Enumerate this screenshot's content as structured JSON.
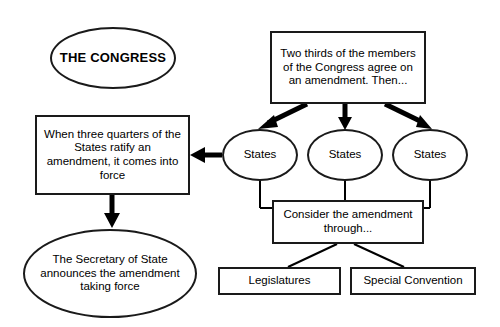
{
  "diagram": {
    "canvas": {
      "width": 500,
      "height": 327
    },
    "colors": {
      "background": "#ffffff",
      "stroke": "#1a1a1a",
      "text": "#000000"
    },
    "nodes": [
      {
        "id": "congress",
        "label": "THE CONGRESS",
        "shape": "ellipse"
      },
      {
        "id": "two-thirds",
        "label": "Two thirds of the members of the Congress agree on an amendment. Then...",
        "shape": "rectangle"
      },
      {
        "id": "ratify",
        "label": "When three quarters of the States ratify an amendment, it comes into force",
        "shape": "rectangle"
      },
      {
        "id": "states-1",
        "label": "States",
        "shape": "ellipse"
      },
      {
        "id": "states-2",
        "label": "States",
        "shape": "ellipse"
      },
      {
        "id": "states-3",
        "label": "States",
        "shape": "ellipse"
      },
      {
        "id": "consider",
        "label": "Consider the amendment through...",
        "shape": "rectangle"
      },
      {
        "id": "secretary",
        "label": "The Secretary of State announces the amendment taking force",
        "shape": "ellipse"
      },
      {
        "id": "legislatures",
        "label": "Legislatures",
        "shape": "rectangle"
      },
      {
        "id": "special-convention",
        "label": "Special Convention",
        "shape": "rectangle"
      }
    ],
    "edges": [
      {
        "from": "two-thirds",
        "to": "states-1",
        "style": "thick-arrow"
      },
      {
        "from": "two-thirds",
        "to": "states-2",
        "style": "thick-arrow"
      },
      {
        "from": "two-thirds",
        "to": "states-3",
        "style": "thick-arrow"
      },
      {
        "from": "states-1",
        "to": "ratify",
        "style": "thick-arrow"
      },
      {
        "from": "states-1",
        "to": "consider",
        "style": "plain-line"
      },
      {
        "from": "states-2",
        "to": "consider",
        "style": "plain-line"
      },
      {
        "from": "states-3",
        "to": "consider",
        "style": "plain-line"
      },
      {
        "from": "ratify",
        "to": "secretary",
        "style": "thick-arrow"
      },
      {
        "from": "consider",
        "to": "legislatures",
        "style": "plain-line"
      },
      {
        "from": "consider",
        "to": "special-convention",
        "style": "plain-line"
      }
    ]
  }
}
